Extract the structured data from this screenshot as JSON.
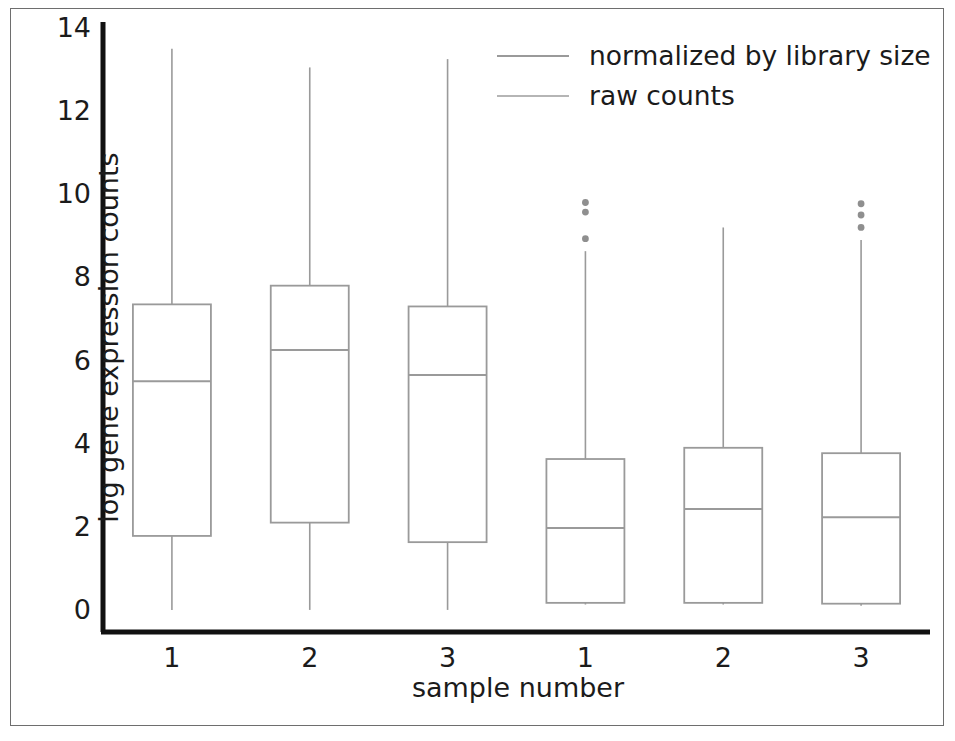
{
  "chart_data": {
    "type": "box",
    "title": "",
    "xlabel": "sample number",
    "ylabel": "log gene expression counts",
    "ylim": [
      0,
      14
    ],
    "yticks": [
      0,
      2,
      4,
      6,
      8,
      10,
      12,
      14
    ],
    "xticklabels": [
      "1",
      "2",
      "3",
      "1",
      "2",
      "3"
    ],
    "grid": false,
    "legend_position": "upper right",
    "legend": [
      {
        "label": "normalized by library size",
        "color": "#9a9a9a"
      },
      {
        "label": "raw counts",
        "color": "#b5b5b5"
      }
    ],
    "boxes": [
      {
        "name": "raw-counts-sample-1",
        "group": "raw counts",
        "x_label": "1",
        "whisker_low": 0.05,
        "q1": 1.83,
        "median": 5.55,
        "q3": 7.4,
        "whisker_high": 13.55,
        "outliers": []
      },
      {
        "name": "raw-counts-sample-2",
        "group": "raw counts",
        "x_label": "2",
        "whisker_low": 0.05,
        "q1": 2.15,
        "median": 6.3,
        "q3": 7.85,
        "whisker_high": 13.1,
        "outliers": []
      },
      {
        "name": "raw-counts-sample-3",
        "group": "raw counts",
        "x_label": "3",
        "whisker_low": 0.05,
        "q1": 1.68,
        "median": 5.7,
        "q3": 7.35,
        "whisker_high": 13.3,
        "outliers": []
      },
      {
        "name": "normalized-sample-1",
        "group": "normalized by library size",
        "x_label": "1",
        "whisker_low": 0.18,
        "q1": 0.22,
        "median": 2.02,
        "q3": 3.68,
        "whisker_high": 8.68,
        "outliers": [
          9.85,
          9.62,
          8.98
        ]
      },
      {
        "name": "normalized-sample-2",
        "group": "normalized by library size",
        "x_label": "2",
        "whisker_low": 0.18,
        "q1": 0.22,
        "median": 2.48,
        "q3": 3.95,
        "whisker_high": 9.25,
        "outliers": []
      },
      {
        "name": "normalized-sample-3",
        "group": "normalized by library size",
        "x_label": "3",
        "whisker_low": 0.15,
        "q1": 0.2,
        "median": 2.28,
        "q3": 3.82,
        "whisker_high": 8.95,
        "outliers": [
          9.82,
          9.55,
          9.25
        ]
      }
    ],
    "colors": {
      "axis": "#111111",
      "box_line": "#9a9a9a",
      "frame": "#6e6e6e",
      "text": "#1b1b1b",
      "background": "#ffffff"
    }
  }
}
